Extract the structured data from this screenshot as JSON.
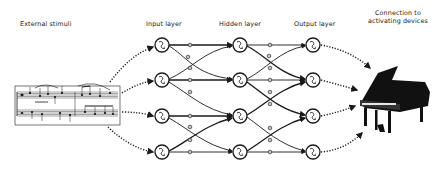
{
  "labels": {
    "external_stimuli": "External stimuli",
    "input_layer": "Input layer",
    "hidden_layer": "Hidden layer",
    "output_layer": "Output layer",
    "connection_line1": "Connection to",
    "connection_line2": "activating devices"
  },
  "layers": {
    "input": {
      "x": 162,
      "nodes_y": [
        45,
        80,
        116,
        152
      ]
    },
    "hidden": {
      "x": 240,
      "nodes_y": [
        45,
        80,
        116,
        152
      ]
    },
    "output": {
      "x": 313,
      "nodes_y": [
        45,
        80,
        116,
        152
      ]
    }
  },
  "stimulus": {
    "type": "sheet-music-icon",
    "x": 15,
    "y": 85,
    "width": 105,
    "height": 40
  },
  "device": {
    "type": "grand-piano-icon",
    "x": 355,
    "y": 65,
    "width": 75,
    "height": 70
  },
  "colors": {
    "ink": "#1a1a1a",
    "background": "#ffffff"
  }
}
